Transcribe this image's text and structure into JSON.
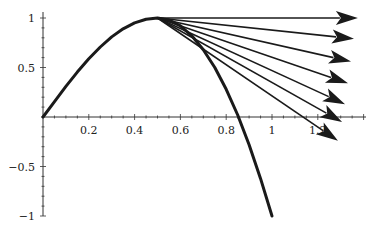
{
  "chart_data": {
    "type": "line",
    "title": "",
    "xlabel": "",
    "ylabel": "",
    "xlim": [
      0,
      1.41
    ],
    "ylim": [
      -1,
      1.05
    ],
    "grid": false,
    "legend": null,
    "x_ticks": [
      {
        "value": 0.2,
        "label": "0.2"
      },
      {
        "value": 0.4,
        "label": "0.4"
      },
      {
        "value": 0.6,
        "label": "0.6"
      },
      {
        "value": 0.8,
        "label": "0.8"
      },
      {
        "value": 1.0,
        "label": "1"
      },
      {
        "value": 1.2,
        "label": "1.2"
      }
    ],
    "y_ticks": [
      {
        "value": 1.0,
        "label": "1"
      },
      {
        "value": 0.5,
        "label": "0.5"
      },
      {
        "value": -0.5,
        "label": "−0.5"
      },
      {
        "value": -1.0,
        "label": "−1"
      }
    ],
    "series": [
      {
        "name": "curve",
        "x": [
          0,
          0.05,
          0.1,
          0.15,
          0.2,
          0.25,
          0.3,
          0.35,
          0.4,
          0.45,
          0.5,
          0.55,
          0.6,
          0.65,
          0.7,
          0.75,
          0.8,
          0.85,
          0.9,
          0.95,
          1.0
        ],
        "values": [
          0,
          0.156,
          0.309,
          0.454,
          0.588,
          0.707,
          0.809,
          0.891,
          0.951,
          0.988,
          1.0,
          0.98,
          0.92,
          0.82,
          0.68,
          0.5,
          0.28,
          0.02,
          -0.28,
          -0.62,
          -1.0
        ]
      }
    ],
    "arrows": [
      {
        "from": [
          0.5,
          1.0
        ],
        "to": [
          1.375,
          1.0
        ]
      },
      {
        "from": [
          0.5,
          1.0
        ],
        "to": [
          1.358,
          0.79
        ]
      },
      {
        "from": [
          0.5,
          1.0
        ],
        "to": [
          1.345,
          0.56
        ]
      },
      {
        "from": [
          0.5,
          1.0
        ],
        "to": [
          1.332,
          0.34
        ]
      },
      {
        "from": [
          0.5,
          1.0
        ],
        "to": [
          1.319,
          0.13
        ]
      },
      {
        "from": [
          0.5,
          1.0
        ],
        "to": [
          1.306,
          -0.05
        ]
      },
      {
        "from": [
          0.5,
          1.0
        ],
        "to": [
          1.288,
          -0.24
        ]
      }
    ]
  }
}
